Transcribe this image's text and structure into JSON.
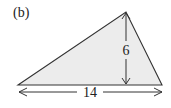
{
  "figure": {
    "label": "(b)",
    "shape": "triangle",
    "fill_color": "#ececec",
    "stroke_color": "#333333",
    "vertices": {
      "left": [
        18,
        85
      ],
      "apex": [
        126,
        12
      ],
      "right": [
        162,
        85
      ]
    },
    "base": {
      "label": "14",
      "value": 14
    },
    "height": {
      "label": "6",
      "value": 6
    }
  }
}
